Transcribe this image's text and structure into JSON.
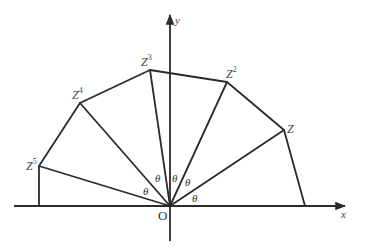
{
  "diagram": {
    "title": "",
    "origin": {
      "label": "O",
      "x": 170,
      "y": 206
    },
    "axes": {
      "x": {
        "label": "x",
        "from": [
          14,
          206
        ],
        "to": [
          345,
          206
        ]
      },
      "y": {
        "label": "y",
        "from": [
          170,
          241
        ],
        "to": [
          170,
          15
        ]
      }
    },
    "angle_label": "θ",
    "points": [
      {
        "id": "Z1",
        "base": "Z",
        "sup": "",
        "x": 284,
        "y": 130
      },
      {
        "id": "Z2",
        "base": "Z",
        "sup": "2",
        "x": 227,
        "y": 82
      },
      {
        "id": "Z3",
        "base": "Z",
        "sup": "3",
        "x": 150,
        "y": 70
      },
      {
        "id": "Z4",
        "base": "Z",
        "sup": "4",
        "x": 80,
        "y": 103
      },
      {
        "id": "Z5",
        "base": "Z",
        "sup": "5",
        "x": 39,
        "y": 166
      }
    ],
    "perpendicular_feet": [
      {
        "from": "Z1",
        "x": 305,
        "y": 206
      },
      {
        "from": "Z5",
        "x": 39,
        "y": 206
      }
    ],
    "angle_labels_count": 5,
    "colors": {
      "stroke": "#2b2b2b",
      "text": "#444444",
      "background": "#ffffff"
    }
  }
}
